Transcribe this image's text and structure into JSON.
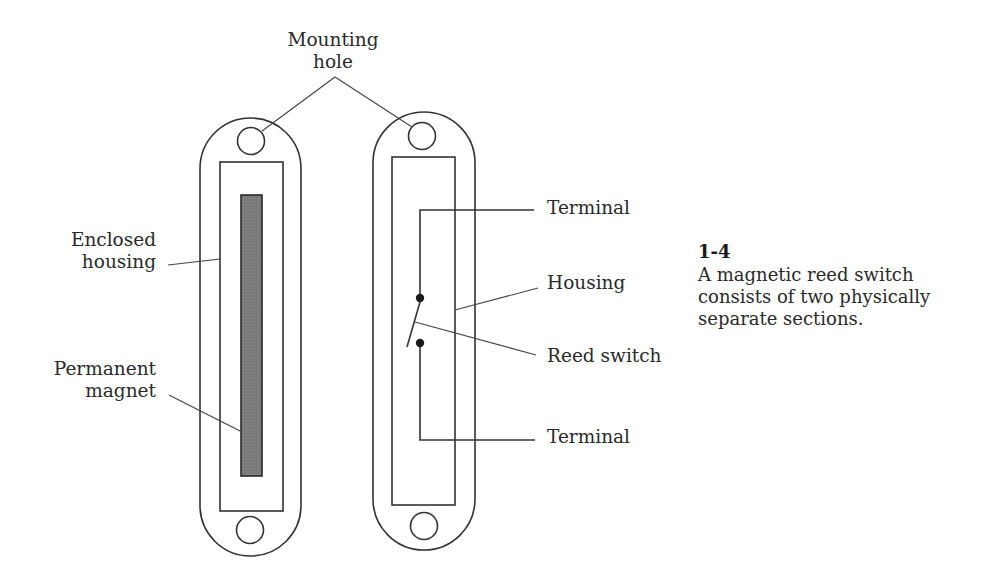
{
  "figure": {
    "number": "1-4",
    "caption_lines": [
      "A magnetic reed switch",
      "consists of two physically",
      "separate sections."
    ]
  },
  "labels": {
    "mounting_hole": [
      "Mounting",
      "hole"
    ],
    "enclosed_housing": [
      "Enclosed",
      "housing"
    ],
    "permanent_magnet": [
      "Permanent",
      "magnet"
    ],
    "terminal_top": "Terminal",
    "housing": "Housing",
    "reed_switch": "Reed switch",
    "terminal_bottom": "Terminal"
  },
  "colors": {
    "line": "#333333",
    "magnet_fill": "#7a7a7a",
    "text": "#2a2a2a",
    "background": "#ffffff"
  }
}
